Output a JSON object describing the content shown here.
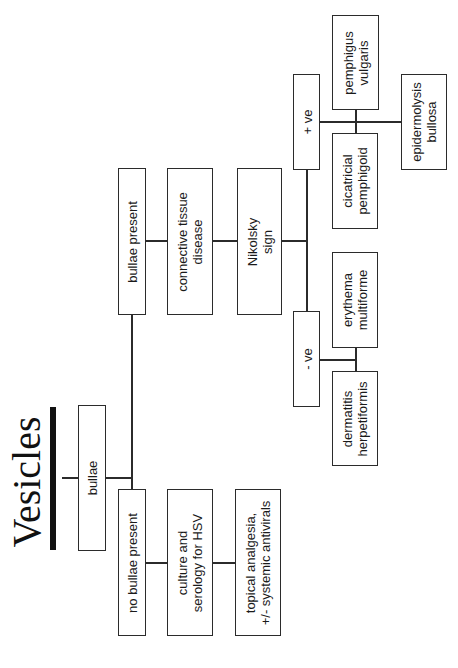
{
  "title": "Vesicles",
  "nodes": {
    "bullae": {
      "lines": [
        "bullae"
      ]
    },
    "bullae_present": {
      "lines": [
        "bullae present"
      ]
    },
    "no_bullae_present": {
      "lines": [
        "no bullae present"
      ]
    },
    "connective_tissue_disease": {
      "lines": [
        "connective tissue",
        "disease"
      ]
    },
    "culture_serology": {
      "lines": [
        "culture and",
        "serology for HSV"
      ]
    },
    "nikolsky_sign": {
      "lines": [
        "Nikolsky",
        "sign"
      ]
    },
    "topical_analgesia": {
      "lines": [
        "topical analgesia,",
        "+/- systemic antivirals"
      ]
    },
    "positive": {
      "lines": [
        "+ ve"
      ]
    },
    "negative": {
      "lines": [
        "- ve"
      ]
    },
    "pemphigus_vulgaris": {
      "lines": [
        "pemphigus",
        "vulgaris"
      ]
    },
    "cicatricial_pemphigoid": {
      "lines": [
        "cicatricial",
        "pemphigoid"
      ]
    },
    "epidermolysis_bullosa": {
      "lines": [
        "epidermolysis",
        "bullosa"
      ]
    },
    "erythema_multiforme": {
      "lines": [
        "erythema",
        "multiforme"
      ]
    },
    "dermatitis_herpetiformis": {
      "lines": [
        "dermatitis",
        "herpetiformis"
      ]
    }
  },
  "edges": [
    [
      "title",
      "bullae"
    ],
    [
      "bullae",
      "bullae_present"
    ],
    [
      "bullae",
      "no_bullae_present"
    ],
    [
      "bullae_present",
      "connective_tissue_disease"
    ],
    [
      "connective_tissue_disease",
      "nikolsky_sign"
    ],
    [
      "nikolsky_sign",
      "positive"
    ],
    [
      "nikolsky_sign",
      "negative"
    ],
    [
      "positive",
      "pemphigus_vulgaris"
    ],
    [
      "positive",
      "cicatricial_pemphigoid"
    ],
    [
      "positive",
      "epidermolysis_bullosa"
    ],
    [
      "negative",
      "erythema_multiforme"
    ],
    [
      "negative",
      "dermatitis_herpetiformis"
    ],
    [
      "no_bullae_present",
      "culture_serology"
    ],
    [
      "culture_serology",
      "topical_analgesia"
    ]
  ]
}
